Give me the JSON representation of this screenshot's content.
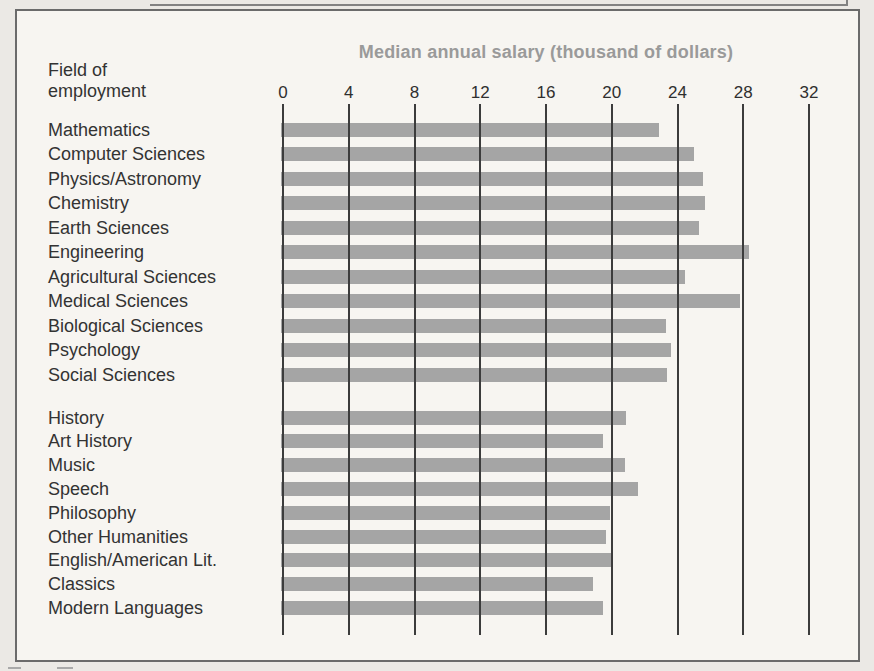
{
  "chart_data": {
    "type": "bar",
    "orientation": "horizontal",
    "title": "Median annual salary (thousand of dollars)",
    "category_axis_label": "Field of employment",
    "value_axis_ticks": [
      0,
      4,
      8,
      12,
      16,
      20,
      24,
      28,
      32
    ],
    "value_axis_range": [
      0,
      32
    ],
    "grid": true,
    "groups": [
      {
        "items": [
          {
            "label": "Mathematics",
            "value": 23.0
          },
          {
            "label": "Computer Sciences",
            "value": 25.1
          },
          {
            "label": "Physics/Astronomy",
            "value": 25.7
          },
          {
            "label": "Chemistry",
            "value": 25.8
          },
          {
            "label": "Earth Sciences",
            "value": 25.4
          },
          {
            "label": "Engineering",
            "value": 28.5
          },
          {
            "label": "Agricultural Sciences",
            "value": 24.6
          },
          {
            "label": "Medical Sciences",
            "value": 27.9
          },
          {
            "label": "Biological Sciences",
            "value": 23.4
          },
          {
            "label": "Psychology",
            "value": 23.7
          },
          {
            "label": "Social Sciences",
            "value": 23.5
          }
        ]
      },
      {
        "items": [
          {
            "label": "History",
            "value": 21.0
          },
          {
            "label": "Art History",
            "value": 19.6
          },
          {
            "label": "Music",
            "value": 20.9
          },
          {
            "label": "Speech",
            "value": 21.7
          },
          {
            "label": "Philosophy",
            "value": 20.0
          },
          {
            "label": "Other Humanities",
            "value": 19.8
          },
          {
            "label": "English/American Lit.",
            "value": 20.1
          },
          {
            "label": "Classics",
            "value": 19.0
          },
          {
            "label": "Modern Languages",
            "value": 19.6
          }
        ]
      }
    ],
    "colors": {
      "bar": "#a5a5a5",
      "gridline": "#3c3c3c",
      "title": "#9a9a9a",
      "category_label": "#333333",
      "plot_background": "#f7f5f1",
      "page_background": "#ebe9e5",
      "box_border": "#6b6b6b"
    }
  }
}
